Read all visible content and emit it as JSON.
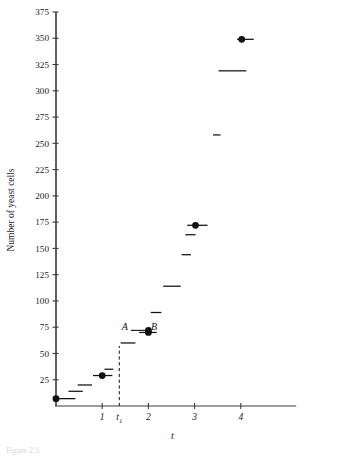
{
  "chart_data": {
    "type": "scatter",
    "title": "",
    "xlabel": "t",
    "ylabel": "Number of yeast cells",
    "xlim": [
      -0.25,
      5.2
    ],
    "ylim": [
      0,
      380
    ],
    "grid": false,
    "legend": "none",
    "y_ticks": [
      25,
      50,
      75,
      100,
      125,
      150,
      175,
      200,
      225,
      250,
      275,
      300,
      325,
      350,
      375
    ],
    "y_tick_labels": [
      "25",
      "50",
      "75",
      "100",
      "125",
      "150",
      "175",
      "200",
      "225",
      "250",
      "275",
      "300",
      "325",
      "350",
      "375"
    ],
    "x_ticks": [
      1,
      2,
      3,
      4
    ],
    "x_tick_labels": [
      "1",
      "2",
      "3",
      "4"
    ],
    "x_extra_tick": {
      "value": 1.37,
      "label": "t",
      "subscript": "1"
    },
    "series": [
      {
        "name": "yeast cell count",
        "kind": "horizontal-dash-segments",
        "points": [
          {
            "x": 0.0,
            "y": 7,
            "x_end": 0.42,
            "marker": "filled-circle"
          },
          {
            "x": 0.27,
            "y": 14,
            "x_end": 0.58,
            "marker": "none"
          },
          {
            "x": 0.47,
            "y": 20,
            "x_end": 0.78,
            "marker": "none"
          },
          {
            "x": 0.8,
            "y": 29,
            "x_end": 1.22,
            "marker": "filled-circle",
            "marker_x": 1.0
          },
          {
            "x": 1.05,
            "y": 35,
            "x_end": 1.24,
            "marker": "none"
          },
          {
            "x": 1.4,
            "y": 60,
            "x_end": 1.72,
            "marker": "none"
          },
          {
            "x": 1.8,
            "y": 70,
            "x_end": 2.18,
            "marker": "filled-circle",
            "marker_x": 2.0
          },
          {
            "x": 2.05,
            "y": 89,
            "x_end": 2.28,
            "marker": "none"
          },
          {
            "x": 2.32,
            "y": 114,
            "x_end": 2.7,
            "marker": "none"
          },
          {
            "x": 2.72,
            "y": 144,
            "x_end": 2.92,
            "marker": "none"
          },
          {
            "x": 2.8,
            "y": 163,
            "x_end": 3.02,
            "marker": "none"
          },
          {
            "x": 2.84,
            "y": 172,
            "x_end": 3.28,
            "marker": "filled-circle",
            "marker_x": 3.02
          },
          {
            "x": 3.4,
            "y": 258,
            "x_end": 3.56,
            "marker": "none"
          },
          {
            "x": 3.52,
            "y": 319,
            "x_end": 4.12,
            "marker": "none"
          },
          {
            "x": 3.92,
            "y": 349,
            "x_end": 4.28,
            "marker": "filled-circle",
            "marker_x": 4.02
          }
        ]
      }
    ],
    "annotations": [
      {
        "id": "dashed-line",
        "type": "vertical-dashed",
        "x": 1.37,
        "y_from": 0,
        "y_to": 57
      },
      {
        "id": "secant-label-A",
        "type": "text",
        "text": "A",
        "x": 1.49,
        "y": 75,
        "italic": true
      },
      {
        "id": "secant-label-B",
        "type": "text",
        "text": "B",
        "x": 2.12,
        "y": 75,
        "italic": true
      },
      {
        "id": "secant-connector",
        "type": "segment",
        "x_from": 1.62,
        "x_to": 2.0,
        "y": 72
      },
      {
        "id": "secant-point-B",
        "type": "filled-circle",
        "x": 2.0,
        "y": 72
      }
    ]
  },
  "axis": {
    "y_axis_label": "Number of yeast cells",
    "x_axis_label": "t",
    "t1_label": "t",
    "t1_subscript": "1"
  },
  "caption": {
    "text": "Figure 2.3"
  },
  "colors": {
    "axis": "#3a3a3a",
    "data": "#111111",
    "background": "#ffffff",
    "caption": "#dcdcdc"
  }
}
